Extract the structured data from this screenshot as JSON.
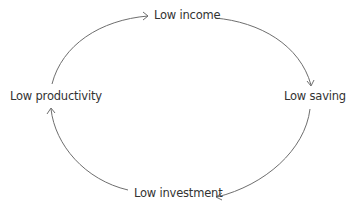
{
  "diagram": {
    "type": "cycle",
    "nodes": [
      {
        "id": "income",
        "label": "Low income"
      },
      {
        "id": "saving",
        "label": "Low saving"
      },
      {
        "id": "investment",
        "label": "Low investment"
      },
      {
        "id": "productivity",
        "label": "Low productivity"
      }
    ],
    "edges": [
      {
        "from": "productivity",
        "to": "income"
      },
      {
        "from": "income",
        "to": "saving"
      },
      {
        "from": "saving",
        "to": "investment"
      },
      {
        "from": "investment",
        "to": "productivity"
      }
    ],
    "colors": {
      "line": "#6e6e6e",
      "text": "#333333",
      "background": "#ffffff"
    }
  }
}
